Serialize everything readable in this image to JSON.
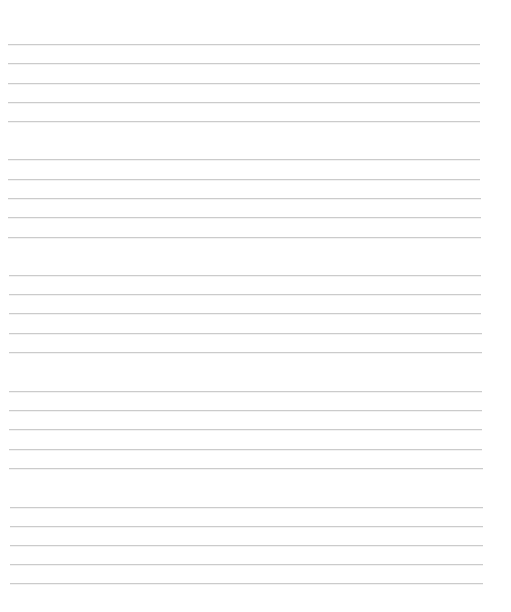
{
  "page": {
    "type": "blank-lined-writing-sheet",
    "background_color": "#ffffff",
    "line_color": "#cbcbcb",
    "line_thickness_px": 1,
    "line_groups": [
      {
        "lines": [
          {
            "y": 44,
            "x1": 8,
            "x2": 480
          },
          {
            "y": 63,
            "x1": 8,
            "x2": 480
          },
          {
            "y": 83,
            "x1": 8,
            "x2": 480
          },
          {
            "y": 102,
            "x1": 8,
            "x2": 480
          },
          {
            "y": 121,
            "x1": 8,
            "x2": 480
          }
        ]
      },
      {
        "lines": [
          {
            "y": 159,
            "x1": 8,
            "x2": 480
          },
          {
            "y": 179,
            "x1": 8,
            "x2": 480
          },
          {
            "y": 198,
            "x1": 8,
            "x2": 481
          },
          {
            "y": 217,
            "x1": 8,
            "x2": 481
          },
          {
            "y": 237,
            "x1": 8,
            "x2": 481
          }
        ]
      },
      {
        "lines": [
          {
            "y": 275,
            "x1": 9,
            "x2": 481
          },
          {
            "y": 294,
            "x1": 9,
            "x2": 481
          },
          {
            "y": 313,
            "x1": 9,
            "x2": 481
          },
          {
            "y": 333,
            "x1": 9,
            "x2": 482
          },
          {
            "y": 352,
            "x1": 9,
            "x2": 482
          }
        ]
      },
      {
        "lines": [
          {
            "y": 391,
            "x1": 9,
            "x2": 482
          },
          {
            "y": 410,
            "x1": 9,
            "x2": 482
          },
          {
            "y": 429,
            "x1": 9,
            "x2": 482
          },
          {
            "y": 449,
            "x1": 9,
            "x2": 482
          },
          {
            "y": 468,
            "x1": 9,
            "x2": 483
          }
        ]
      },
      {
        "lines": [
          {
            "y": 507,
            "x1": 10,
            "x2": 483
          },
          {
            "y": 526,
            "x1": 10,
            "x2": 483
          },
          {
            "y": 545,
            "x1": 10,
            "x2": 483
          },
          {
            "y": 564,
            "x1": 10,
            "x2": 483
          },
          {
            "y": 583,
            "x1": 10,
            "x2": 483
          }
        ]
      }
    ]
  }
}
